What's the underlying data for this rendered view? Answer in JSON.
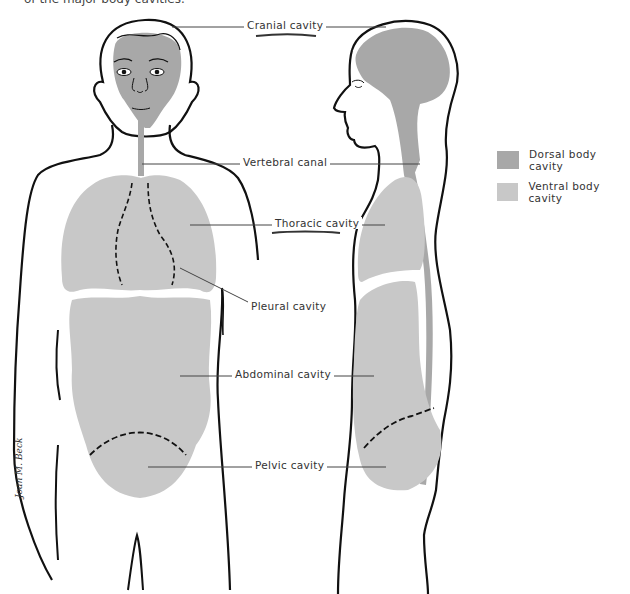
{
  "caption": "of the major body cavities.",
  "colors": {
    "dorsal": "#a8a8a8",
    "ventral": "#c8c8c8",
    "outline": "#111111",
    "leader": "#444444"
  },
  "labels": {
    "cranial": "Cranial cavity",
    "vertebral": "Vertebral canal",
    "thoracic": "Thoracic cavity",
    "pleural": "Pleural cavity",
    "abdominal": "Abdominal cavity",
    "pelvic": "Pelvic cavity"
  },
  "legend": {
    "items": [
      {
        "label": "Dorsal body cavity",
        "color": "#a8a8a8"
      },
      {
        "label": "Ventral body cavity",
        "color": "#c8c8c8"
      }
    ]
  },
  "signature": "Joan M. Beck"
}
